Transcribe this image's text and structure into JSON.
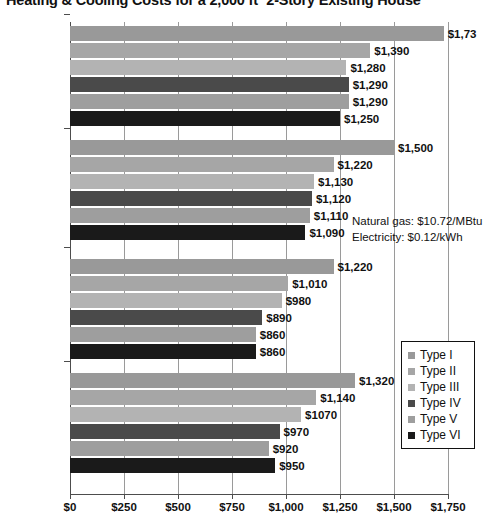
{
  "chart_data": {
    "type": "bar",
    "orientation": "horizontal",
    "title": "Heating & Cooling Costs for a 2,000 ft² 2-Story Existing House",
    "title_clipped": true,
    "xlabel": "",
    "ylabel": "",
    "xlim": [
      0,
      1750
    ],
    "grid": true,
    "legend_position": "right-inside",
    "xticks": [
      0,
      250,
      500,
      750,
      1000,
      1250,
      1500,
      1750
    ],
    "xtick_labels": [
      "$0",
      "$250",
      "$500",
      "$750",
      "$1,000",
      "$1,250",
      "$1,500",
      "$1,750"
    ],
    "categories": [
      "Northern",
      "NorthCentral",
      "SouthCentral",
      "Southern"
    ],
    "series": [
      {
        "name": "Type I",
        "color": "#999999",
        "values": [
          1730,
          1500,
          1220,
          1320
        ],
        "labels": [
          "$1,73",
          "$1,500",
          "$1,220",
          "$1,320"
        ]
      },
      {
        "name": "Type II",
        "color": "#a6a6a6",
        "values": [
          1390,
          1220,
          1010,
          1140
        ],
        "labels": [
          "$1,390",
          "$1,220",
          "$1,010",
          "$1,140"
        ]
      },
      {
        "name": "Type III",
        "color": "#b3b3b3",
        "values": [
          1280,
          1130,
          980,
          1070
        ],
        "labels": [
          "$1,280",
          "$1,130",
          "$980",
          "$1070"
        ]
      },
      {
        "name": "Type IV",
        "color": "#4a4a4a",
        "values": [
          1290,
          1120,
          890,
          970
        ],
        "labels": [
          "$1,290",
          "$1,120",
          "$890",
          "$970"
        ]
      },
      {
        "name": "Type V",
        "color": "#9e9e9e",
        "values": [
          1290,
          1110,
          860,
          920
        ],
        "labels": [
          "$1,290",
          "$1,110",
          "$860",
          "$920"
        ]
      },
      {
        "name": "Type VI",
        "color": "#1a1a1a",
        "values": [
          1250,
          1090,
          860,
          950
        ],
        "labels": [
          "$1,250",
          "$1,090",
          "$860",
          "$950"
        ]
      }
    ],
    "annotations": [
      {
        "text": "Natural gas: $10.72/MBtu",
        "x": 352,
        "y": 215
      },
      {
        "text": "Electricity: $0.12/kWh",
        "x": 352,
        "y": 231
      }
    ]
  }
}
